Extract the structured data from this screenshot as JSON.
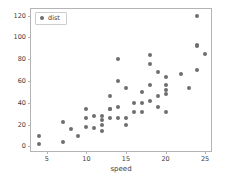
{
  "chart_data": {
    "type": "scatter",
    "title": "",
    "xlabel": "speed",
    "ylabel": "",
    "xlim": [
      3.0,
      26.0
    ],
    "ylim": [
      -6.0,
      126.0
    ],
    "grid": false,
    "legend_position": "upper left",
    "marker_color": "#6e6e6e",
    "series": [
      {
        "name": "dist",
        "x": [
          4,
          4,
          7,
          7,
          8,
          9,
          10,
          10,
          10,
          11,
          11,
          12,
          12,
          12,
          12,
          13,
          13,
          13,
          13,
          14,
          14,
          14,
          14,
          15,
          15,
          15,
          16,
          16,
          17,
          17,
          17,
          18,
          18,
          18,
          18,
          19,
          19,
          19,
          20,
          20,
          20,
          20,
          20,
          22,
          23,
          24,
          24,
          24,
          24,
          25
        ],
        "y": [
          2,
          10,
          4,
          22,
          16,
          10,
          18,
          26,
          34,
          17,
          28,
          14,
          20,
          24,
          28,
          26,
          34,
          34,
          46,
          26,
          36,
          60,
          80,
          20,
          26,
          54,
          32,
          40,
          32,
          40,
          50,
          42,
          56,
          76,
          84,
          36,
          46,
          68,
          32,
          48,
          52,
          56,
          64,
          66,
          54,
          70,
          92,
          93,
          120,
          85
        ]
      }
    ],
    "xticks": [
      5,
      10,
      15,
      20,
      25
    ],
    "yticks": [
      0,
      20,
      40,
      60,
      80,
      100,
      120
    ]
  },
  "legend": {
    "entries": [
      {
        "label": "dist"
      }
    ]
  },
  "axis": {
    "xlabel": "speed"
  }
}
